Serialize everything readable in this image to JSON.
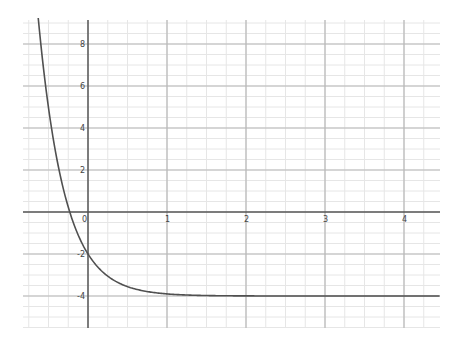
{
  "chart_data": {
    "type": "line",
    "title": "",
    "xlabel": "",
    "ylabel": "",
    "function": "f(x) = 2e^(-3x) - 4",
    "series": [
      {
        "name": "f(x)",
        "x": [
          -0.63,
          -0.5,
          -0.4,
          -0.3,
          -0.23,
          -0.2,
          -0.1,
          0,
          0.1,
          0.2,
          0.3,
          0.5,
          0.75,
          1,
          1.5,
          2,
          3,
          4,
          4.45
        ],
        "values": [
          9.2,
          4.96,
          2.64,
          0.92,
          0.0,
          -0.36,
          -1.3,
          -2.0,
          -2.52,
          -2.9,
          -3.19,
          -3.55,
          -3.79,
          -3.9,
          -3.98,
          -4.0,
          -4.0,
          -4.0,
          -4.0
        ]
      }
    ],
    "xlim": [
      -0.82,
      4.46
    ],
    "ylim": [
      -5.52,
      9.14
    ],
    "x_ticks": [
      {
        "value": 0,
        "label": "0"
      },
      {
        "value": 1,
        "label": "1"
      },
      {
        "value": 2,
        "label": "2"
      },
      {
        "value": 3,
        "label": "3"
      },
      {
        "value": 4,
        "label": "4"
      }
    ],
    "y_ticks": [
      {
        "value": 8,
        "label": "8"
      },
      {
        "value": 6,
        "label": "6"
      },
      {
        "value": 4,
        "label": "4"
      },
      {
        "value": 2,
        "label": "2"
      },
      {
        "value": -2,
        "label": "-2"
      },
      {
        "value": -4,
        "label": "-4"
      }
    ],
    "grid": {
      "major_x": 1,
      "major_y": 2,
      "minor_x": 0.25,
      "minor_y": 0.5
    },
    "asymptote": -4,
    "y_intercept": -2
  },
  "style": {
    "curve_color": "#505050",
    "axis_color": "#555555",
    "major_grid_color": "#b8b8b8",
    "minor_grid_color": "#e6e6e6"
  },
  "layout": {
    "x_origin_px": 88,
    "y_origin_px": 212,
    "px_per_x": 79,
    "px_per_y": 21,
    "plot_left": 23,
    "plot_right": 440,
    "plot_top": 20,
    "plot_bottom": 328
  }
}
